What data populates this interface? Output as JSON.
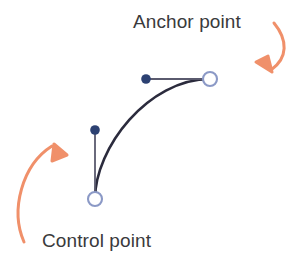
{
  "diagram": {
    "title_labels": {
      "anchor": "Anchor point",
      "control": "Control point"
    },
    "colors": {
      "curve": "#2b2b3d",
      "handle_line": "#4a4a5e",
      "control_dot_fill": "#2c4172",
      "anchor_ring_stroke": "#8b99c6",
      "arrow": "#f0906a",
      "text": "#3a3a3c",
      "background": "#ffffff"
    },
    "geometry": {
      "curve_start": "95,199",
      "curve_end": "210,79",
      "curve_control_1": "95,150",
      "curve_control_2": "150,79",
      "anchor_ring_top": "210,79",
      "anchor_ring_bottom": "95,199",
      "control_dot_top": "146,79",
      "control_dot_bottom": "95,130",
      "handle_top": "146,79 to 210,79",
      "handle_bottom": "95,130 to 95,199"
    },
    "arrows": [
      {
        "name": "anchor-callout-arrow",
        "points_to": "anchor point ring",
        "direction": "down-left"
      },
      {
        "name": "control-callout-arrow",
        "points_to": "control point ring",
        "direction": "up-right"
      }
    ]
  }
}
